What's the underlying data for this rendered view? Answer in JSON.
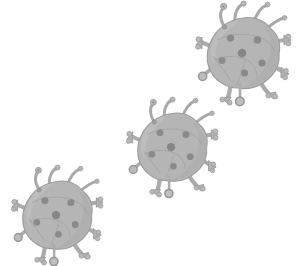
{
  "illustration": {
    "title": "Virus particles illustration",
    "subject": "virus",
    "background_color": "#ffffff",
    "canvas": {
      "width": 306,
      "height": 266
    },
    "style": "flat grayscale cartoon clip-art",
    "count": 3,
    "arrangement": "diagonal from lower-left to upper-right",
    "palette": {
      "body_fill": "#b5b5b5",
      "body_shade": "#a8a8a8",
      "body_highlight": "#c2c2c2",
      "spot_fill": "#8a8a8a",
      "appendage_fill": "#b0b0b0",
      "appendage_tip": "#9a9a9a",
      "outline": "#8f8f8f",
      "line": "#9b9b9b"
    },
    "particles": [
      {
        "id": "virus-top-right",
        "label": "Virus particle 1",
        "position_label": "top right",
        "center_x": 243,
        "center_y": 54,
        "scale": 1.0,
        "rotation_deg": 0,
        "spot_count": 6,
        "antenna_count": 3,
        "spike_count": 4,
        "leg_count": 2
      },
      {
        "id": "virus-middle",
        "label": "Virus particle 2",
        "position_label": "center",
        "center_x": 172,
        "center_y": 148,
        "scale": 0.96,
        "rotation_deg": 0,
        "spot_count": 6,
        "antenna_count": 3,
        "spike_count": 4,
        "leg_count": 2
      },
      {
        "id": "virus-bottom-left",
        "label": "Virus particle 3",
        "position_label": "bottom left",
        "center_x": 57,
        "center_y": 216,
        "scale": 0.96,
        "rotation_deg": 0,
        "spot_count": 6,
        "antenna_count": 3,
        "spike_count": 4,
        "leg_count": 2
      }
    ]
  }
}
